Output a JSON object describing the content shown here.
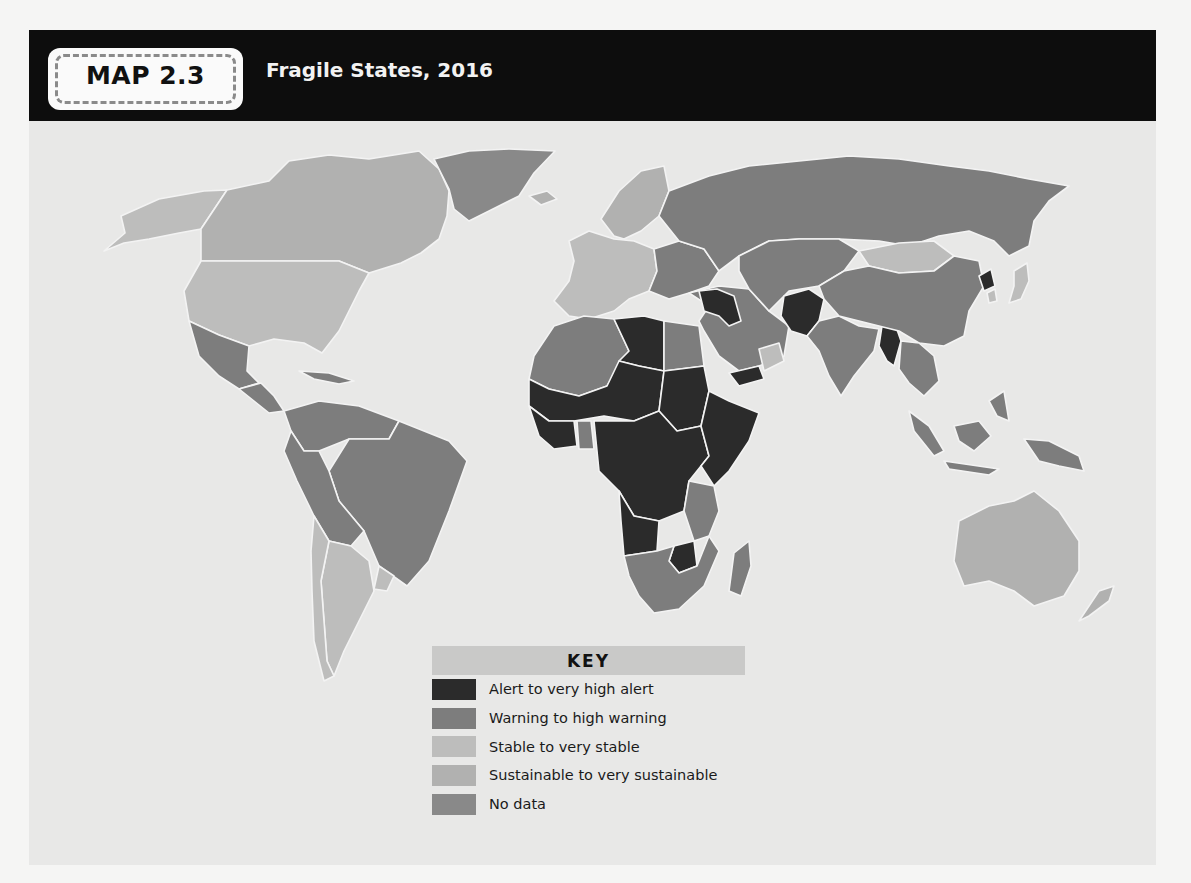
{
  "header": {
    "badge_label": "MAP 2.3",
    "title": "Fragile States, 2016"
  },
  "colors": {
    "alert": "#2b2b2b",
    "warning": "#7d7d7d",
    "stable": "#bdbdbc",
    "sustainable": "#b1b1b0",
    "no_data": "#898989",
    "ocean": "#e8e8e7"
  },
  "key": {
    "title": "KEY",
    "items": [
      {
        "label": "Alert to very high alert",
        "color": "#2b2b2b"
      },
      {
        "label": "Warning to high warning",
        "color": "#7d7d7d"
      },
      {
        "label": "Stable to very stable",
        "color": "#bdbdbc"
      },
      {
        "label": "Sustainable to very sustainable",
        "color": "#b1b1b0"
      },
      {
        "label": "No data",
        "color": "#898989"
      }
    ]
  },
  "regions": [
    {
      "name": "alaska",
      "category": "stable"
    },
    {
      "name": "canada",
      "category": "sustainable"
    },
    {
      "name": "greenland",
      "category": "no_data"
    },
    {
      "name": "united-states",
      "category": "stable"
    },
    {
      "name": "mexico",
      "category": "warning"
    },
    {
      "name": "central-america",
      "category": "warning"
    },
    {
      "name": "caribbean",
      "category": "warning"
    },
    {
      "name": "colombia-venezuela",
      "category": "warning"
    },
    {
      "name": "brazil",
      "category": "warning"
    },
    {
      "name": "peru-bolivia",
      "category": "warning"
    },
    {
      "name": "argentina",
      "category": "stable"
    },
    {
      "name": "chile",
      "category": "stable"
    },
    {
      "name": "uruguay",
      "category": "stable"
    },
    {
      "name": "iceland",
      "category": "sustainable"
    },
    {
      "name": "scandinavia",
      "category": "sustainable"
    },
    {
      "name": "western-europe",
      "category": "stable"
    },
    {
      "name": "eastern-europe",
      "category": "warning"
    },
    {
      "name": "russia",
      "category": "warning"
    },
    {
      "name": "north-africa",
      "category": "warning"
    },
    {
      "name": "libya",
      "category": "alert"
    },
    {
      "name": "egypt",
      "category": "warning"
    },
    {
      "name": "sahel",
      "category": "alert"
    },
    {
      "name": "sudan",
      "category": "alert"
    },
    {
      "name": "west-africa-coast",
      "category": "alert"
    },
    {
      "name": "ghana",
      "category": "warning"
    },
    {
      "name": "central-africa",
      "category": "alert"
    },
    {
      "name": "horn-of-africa",
      "category": "alert"
    },
    {
      "name": "east-africa",
      "category": "warning"
    },
    {
      "name": "angola",
      "category": "alert"
    },
    {
      "name": "zimbabwe",
      "category": "alert"
    },
    {
      "name": "southern-africa",
      "category": "warning"
    },
    {
      "name": "madagascar",
      "category": "warning"
    },
    {
      "name": "middle-east",
      "category": "warning"
    },
    {
      "name": "syria-iraq",
      "category": "alert"
    },
    {
      "name": "yemen",
      "category": "alert"
    },
    {
      "name": "oman",
      "category": "stable"
    },
    {
      "name": "central-asia",
      "category": "warning"
    },
    {
      "name": "afghanistan-pakistan",
      "category": "alert"
    },
    {
      "name": "india",
      "category": "warning"
    },
    {
      "name": "myanmar",
      "category": "alert"
    },
    {
      "name": "mongolia",
      "category": "stable"
    },
    {
      "name": "china",
      "category": "warning"
    },
    {
      "name": "north-korea",
      "category": "alert"
    },
    {
      "name": "japan-korea",
      "category": "stable"
    },
    {
      "name": "southeast-asia",
      "category": "warning"
    },
    {
      "name": "indonesia",
      "category": "warning"
    },
    {
      "name": "papua-new-guinea",
      "category": "warning"
    },
    {
      "name": "australia",
      "category": "sustainable"
    },
    {
      "name": "new-zealand",
      "category": "sustainable"
    }
  ]
}
